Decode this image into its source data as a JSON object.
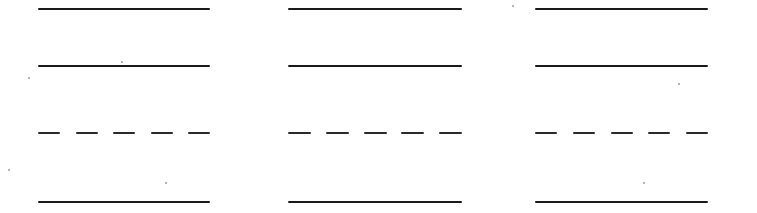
{
  "sheet": {
    "type": "ruled-practice-sheet",
    "background": "#ffffff",
    "ink_color": "#1a1a1a",
    "columns": [
      {
        "id": "column-1",
        "x": 38,
        "width": 172
      },
      {
        "id": "column-2",
        "x": 288,
        "width": 174
      },
      {
        "id": "column-3",
        "x": 535,
        "width": 173
      }
    ],
    "rows": [
      {
        "id": "line-1",
        "y": 8,
        "style": "solid"
      },
      {
        "id": "line-2",
        "y": 65,
        "style": "solid"
      },
      {
        "id": "line-3",
        "y": 132,
        "style": "dashed",
        "dash_count": 5
      },
      {
        "id": "line-4",
        "y": 201,
        "style": "solid"
      }
    ],
    "specks": [
      {
        "x": 121,
        "y": 61
      },
      {
        "x": 28,
        "y": 77
      },
      {
        "x": 8,
        "y": 169
      },
      {
        "x": 512,
        "y": 5
      },
      {
        "x": 678,
        "y": 83
      },
      {
        "x": 643,
        "y": 182
      },
      {
        "x": 165,
        "y": 182
      }
    ]
  }
}
